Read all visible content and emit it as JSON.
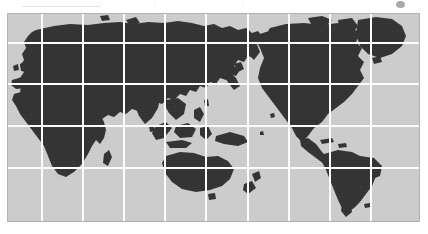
{
  "page": {
    "background_color": "#ffffff"
  },
  "toolbar": {
    "visible_fragment": true,
    "description": "Faint cut-off browser toolbar strip along the top edge",
    "items": [
      {
        "label": "",
        "name": "toolbar-fragment-1"
      },
      {
        "label": "",
        "name": "toolbar-fragment-2"
      },
      {
        "label": "",
        "name": "toolbar-fragment-3"
      },
      {
        "label": "",
        "name": "toolbar-fragment-4"
      },
      {
        "label": "",
        "name": "toolbar-fragment-5"
      },
      {
        "label": "",
        "name": "toolbar-fragment-6"
      },
      {
        "label": "",
        "name": "toolbar-fragment-7"
      },
      {
        "label": "",
        "name": "toolbar-fragment-8"
      }
    ],
    "link_underline_color": "#e2e2e2",
    "badge_color": "#8e8e8e"
  },
  "map": {
    "name": "world-map",
    "projection": "equirectangular",
    "ocean_color": "#cdcdcd",
    "land_color": "#333333",
    "graticule_color": "#ffffff",
    "border_color": "#b3b3b3",
    "frame": {
      "x": 7,
      "y": 13,
      "width": 413,
      "height": 209
    },
    "graticule": {
      "vertical_lines": 9,
      "horizontal_lines": 4,
      "columns": 10,
      "rows": 5,
      "vertical_x": [
        41,
        82,
        123,
        164,
        205,
        247,
        288,
        329,
        370
      ],
      "horizontal_y": [
        42,
        83,
        125,
        167
      ]
    },
    "center_longitude": 120,
    "labels": [],
    "legend": [],
    "regions": [
      {
        "name": "europe"
      },
      {
        "name": "africa"
      },
      {
        "name": "asia"
      },
      {
        "name": "australia"
      },
      {
        "name": "new-zealand"
      },
      {
        "name": "indonesia"
      },
      {
        "name": "north-america"
      },
      {
        "name": "south-america"
      },
      {
        "name": "greenland"
      },
      {
        "name": "japan"
      },
      {
        "name": "madagascar"
      },
      {
        "name": "british-isles"
      }
    ]
  }
}
